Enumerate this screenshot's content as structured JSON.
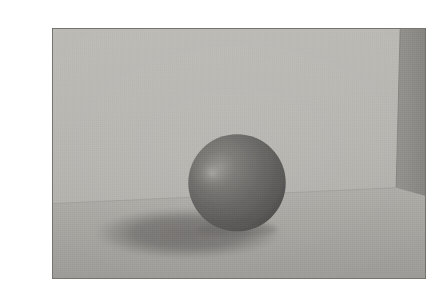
{
  "image": {
    "kind": "raytraced-3d-render",
    "title": "Raytraced sphere on floor with corner wall",
    "canvas": {
      "width": 400,
      "height": 284,
      "background_color": "#ffffff"
    },
    "frame": {
      "left": 12,
      "top": 12,
      "width": 374,
      "height": 251,
      "border_color": "#76746f",
      "border_width": 1
    },
    "palette": {
      "page_background": "#ffffff",
      "frame_border": "#76746f",
      "back_wall_light": "#bab8b3",
      "back_wall_dark": "#ada9a4",
      "side_wall": "#8e8c88",
      "side_wall_dark": "#85837f",
      "floor_light": "#a9a7a2",
      "floor_dark": "#9c9a96",
      "sphere_base": "#5f5e5c",
      "sphere_shade": "#3f3f3e",
      "sphere_highlight": "#9a9894",
      "sphere_terminator_line": "#2e2e2d",
      "cast_shadow": "#747270",
      "corner_edge": "#7d7b77"
    },
    "geometry": {
      "horizon_left": {
        "x": 0,
        "y": 176
      },
      "horizon_right": {
        "x": 374,
        "y": 160
      },
      "corner_edge_x": 345,
      "side_wall_top_x": 349,
      "sphere": {
        "center_x": 185,
        "center_y": 155,
        "radius": 49
      },
      "specular_highlight": {
        "x": 160,
        "y": 145,
        "radius": 22
      },
      "scratch_line": {
        "x1": 172,
        "x2": 204,
        "y": 140,
        "thickness": 2
      },
      "cast_shadow_ellipse": {
        "center_x": 136,
        "center_y": 206,
        "rx": 96,
        "ry": 26
      }
    },
    "objects": [
      {
        "name": "back-wall",
        "label": "Back wall",
        "color": "#b6b4af"
      },
      {
        "name": "side-wall",
        "label": "Right side wall",
        "color": "#8e8c88"
      },
      {
        "name": "floor-plane",
        "label": "Floor plane",
        "color": "#a5a39f"
      },
      {
        "name": "sphere",
        "label": "Shaded sphere",
        "color": "#5f5e5c"
      },
      {
        "name": "cast-shadow",
        "label": "Cast shadow ellipse",
        "color": "#747270"
      }
    ],
    "annotations": {
      "caption": "",
      "alt_text": "A gray shaded sphere resting on a gray floor in front of a two-plane corner wall, with a soft elliptical shadow cast to the lower left and a specular highlight on the upper-left of the sphere."
    }
  }
}
